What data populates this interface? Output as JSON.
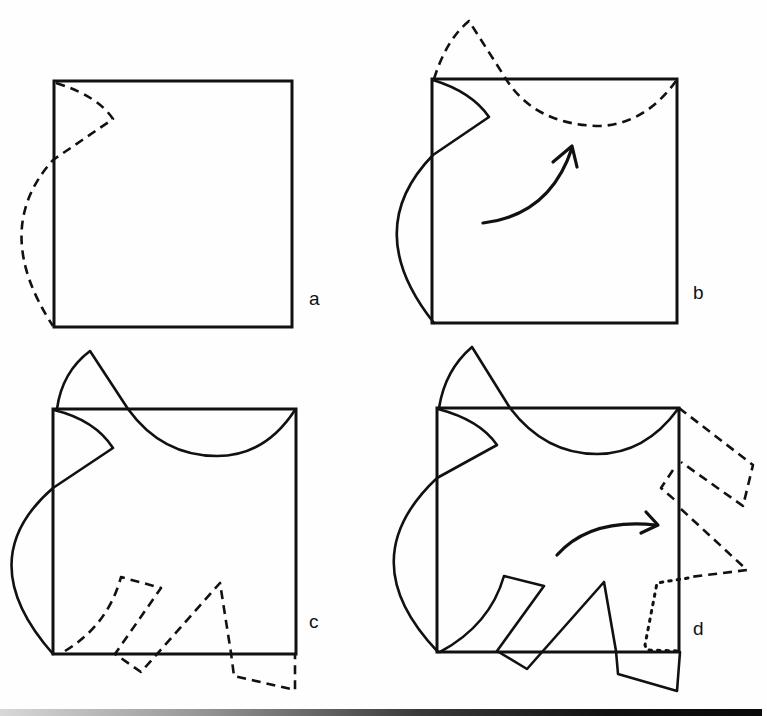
{
  "figure": {
    "colors": {
      "ink": "#111111",
      "background": "#fefefe"
    },
    "panels": [
      {
        "id": "a",
        "label": "a",
        "description": "Square with dashed cut line drawn along the left edge (notch at top, bulge outward)."
      },
      {
        "id": "b",
        "label": "b",
        "description": "Left edge cut is solid; curved arrow shows the shape being rotated onto the top edge (dashed)."
      },
      {
        "id": "c",
        "label": "c",
        "description": "Top and left edges altered; new dashed cut drawn along the bottom edge."
      },
      {
        "id": "d",
        "label": "d",
        "description": "Bottom edge altered; curved arrow shows the cut rotated onto the right edge (dashed and dotted)."
      }
    ]
  }
}
